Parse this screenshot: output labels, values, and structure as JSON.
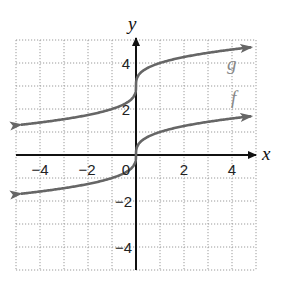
{
  "chart_data": {
    "type": "line",
    "title": "",
    "xlabel": "x",
    "ylabel": "y",
    "xlim": [
      -5,
      5
    ],
    "ylim": [
      -5,
      5
    ],
    "grid": true,
    "x_ticks": [
      -4,
      -2,
      0,
      2,
      4
    ],
    "y_ticks": [
      4,
      2,
      -2,
      -4
    ],
    "x_tick_labels": [
      "−4",
      "−2",
      "0",
      "2",
      "4"
    ],
    "y_tick_labels": [
      "4",
      "2",
      "−2",
      "−4"
    ],
    "series": [
      {
        "name": "g",
        "formula": "cbrt(x) + 3",
        "x": [
          -5,
          -4,
          -3,
          -2,
          -1,
          -0.125,
          0,
          0.125,
          1,
          2,
          3,
          4,
          5
        ],
        "values": [
          1.29,
          1.41,
          1.56,
          1.74,
          2.0,
          2.5,
          3.0,
          3.5,
          4.0,
          4.26,
          4.44,
          4.59,
          4.71
        ],
        "color": "#666666"
      },
      {
        "name": "f",
        "formula": "cbrt(x)",
        "x": [
          -5,
          -4,
          -3,
          -2,
          -1,
          -0.125,
          0,
          0.125,
          1,
          2,
          3,
          4,
          5
        ],
        "values": [
          -1.71,
          -1.59,
          -1.44,
          -1.26,
          -1.0,
          -0.5,
          0.0,
          0.5,
          1.0,
          1.26,
          1.44,
          1.59,
          1.71
        ],
        "color": "#666666"
      }
    ],
    "annotations": [
      {
        "text": "g",
        "x": 4.0,
        "y": 3.9
      },
      {
        "text": "f",
        "x": 4.1,
        "y": 2.4
      }
    ]
  },
  "labels": {
    "x_axis": "x",
    "y_axis": "y",
    "g": "g",
    "f": "f",
    "xt_m4": "−4",
    "xt_m2": "−2",
    "xt_0": "0",
    "xt_2": "2",
    "xt_4": "4",
    "yt_4": "4",
    "yt_2": "2",
    "yt_m2": "−2",
    "yt_m4": "−4"
  }
}
